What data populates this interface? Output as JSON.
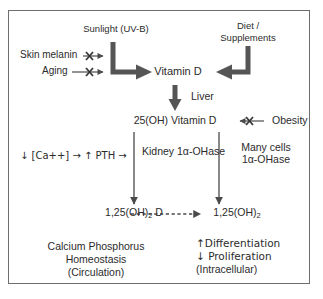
{
  "diagram": {
    "border_color": "#6e6e6e",
    "text_color": "#2b2b2b",
    "arrow_color": "#4a4a4a",
    "thick_arrow_color": "#555555"
  },
  "nodes": {
    "sunlight": "Sunlight (UV-B)",
    "skin_melanin": "Skin melanin",
    "aging": "Aging",
    "diet_supplements_line1": "Diet /",
    "diet_supplements_line2": "Supplements",
    "vitamin_d": "Vitamin D",
    "liver": "Liver",
    "hydroxy_vitamin_d": "25(OH) Vitamin D",
    "obesity": "Obesity",
    "calcium_pth": "↓ [Ca++] → ↑ PTH →",
    "kidney_ohase": "Kidney 1α-OHase",
    "many_cells_line1": "Many cells",
    "many_cells_line2": "1α-OHase",
    "calcitriol_circulating_prefix": "1,25(OH)",
    "calcitriol_circulating_sub": "2",
    "calcitriol_circulating_suffix": " D",
    "calcitriol_cell_prefix": "1,25(OH)",
    "calcitriol_cell_sub": "2",
    "outcome_left_line1": "Calcium Phosphorus",
    "outcome_left_line2": "Homeostasis",
    "outcome_left_line3": "(Circulation)",
    "outcome_right_line1": "↑Differentiation",
    "outcome_right_line2": "↓ Proliferation",
    "outcome_right_line3": "(Intracellular)"
  },
  "edges": {
    "skin_melanin_inhibition": "blocked-arrow",
    "aging_inhibition": "blocked-arrow",
    "sunlight_to_vitamin_d": "thick-elbow-arrow-right",
    "diet_to_vitamin_d": "thick-elbow-arrow-left",
    "vitamin_d_to_25oh": "thick-arrow-down",
    "obesity_inhibition": "blocked-arrow-left",
    "25oh_to_calcitriol_kidney": "thin-arrow-down",
    "25oh_to_calcitriol_cells": "thin-arrow-down",
    "circulating_to_intracellular": "dashed-arrow-right"
  }
}
